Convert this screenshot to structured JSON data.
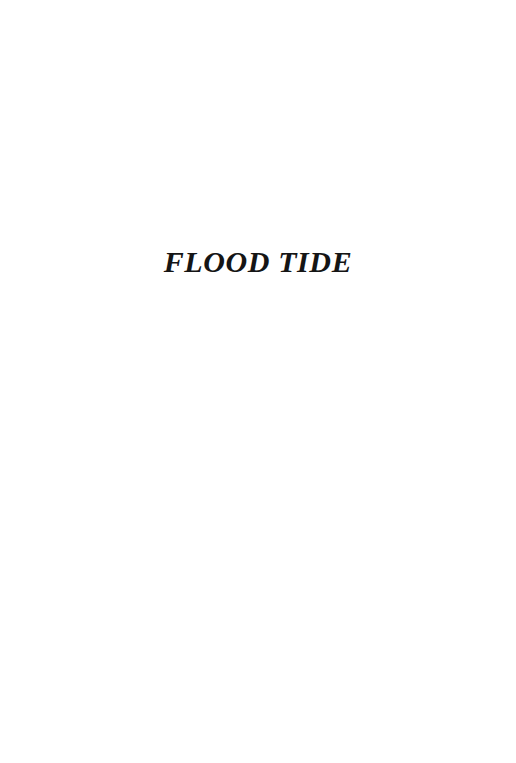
{
  "page": {
    "kind": "half-title-page",
    "background_color": "#ffffff",
    "ink_color": "#151515",
    "title": "FLOOD TIDE"
  }
}
